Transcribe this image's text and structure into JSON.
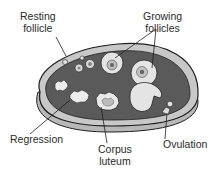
{
  "diagram": {
    "colors": {
      "stroma": "#5a5a5a",
      "cortex_rim": "#b8b8b8",
      "outline": "#1e1e1e",
      "follicle_fill": "#e4e4e4",
      "background": "#ffffff"
    },
    "labels": {
      "resting": {
        "line1": "Resting",
        "line2": "follicle"
      },
      "growing": {
        "line1": "Growing",
        "line2": "follicles"
      },
      "regression": {
        "line1": "Regression"
      },
      "corpus": {
        "line1": "Corpus",
        "line2": "luteum"
      },
      "ovulation": {
        "line1": "Ovulation"
      }
    }
  }
}
